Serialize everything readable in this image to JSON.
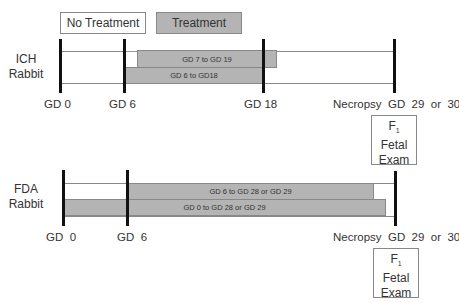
{
  "legend": {
    "no_treatment": "No Treatment",
    "treatment": "Treatment",
    "colors": {
      "no_treatment": "#ffffff",
      "treatment": "#b4b4b4"
    }
  },
  "ich": {
    "species_line1": "ICH",
    "species_line2": "Rabbit",
    "bars": [
      {
        "label": "GD 7 to GD 19",
        "start_gd": 7,
        "end_gd": 19
      },
      {
        "label": "GD 6 to GD18",
        "start_gd": 6,
        "end_gd": 18
      }
    ],
    "markers": {
      "gd0": "GD 0",
      "gd6": "GD 6",
      "gd18": "GD 18",
      "necropsy": "Necropsy  GD  29  or  30"
    },
    "fetal_exam": {
      "f": "F",
      "sub": "1",
      "line2": "Fetal",
      "line3": "Exam"
    }
  },
  "fda": {
    "species_line1": "FDA",
    "species_line2": "Rabbit",
    "bars": [
      {
        "label": "GD 6 to GD 28 or GD 29",
        "start_gd": 6,
        "end_gd": 29
      },
      {
        "label": "GD 0 to GD 28 or GD 29",
        "start_gd": 0,
        "end_gd": 29
      }
    ],
    "markers": {
      "gd0": "GD  0",
      "gd6": "GD  6",
      "necropsy": "Necropsy  GD  29  or  30"
    },
    "fetal_exam": {
      "f": "F",
      "sub": "1",
      "line2": "Fetal",
      "line3": "Exam"
    }
  }
}
